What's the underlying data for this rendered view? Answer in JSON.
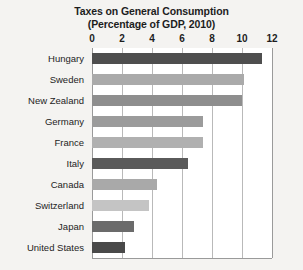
{
  "chart_data": {
    "type": "bar",
    "orientation": "horizontal",
    "title": "Taxes on General Consumption",
    "subtitle": "(Percentage of GDP, 2010)",
    "xlabel": "",
    "ylabel": "",
    "xlim": [
      0,
      12
    ],
    "xticks": [
      0,
      2,
      4,
      6,
      8,
      10,
      12
    ],
    "xtick_labels": [
      "0",
      "2",
      "4",
      "6",
      "8",
      "10",
      "12"
    ],
    "grid": "vertical",
    "legend": "none",
    "categories": [
      "Hungary",
      "Sweden",
      "New Zealand",
      "Germany",
      "France",
      "Italy",
      "Canada",
      "Switzerland",
      "Japan",
      "United States"
    ],
    "values": [
      11.3,
      10.1,
      10.0,
      7.4,
      7.4,
      6.4,
      4.3,
      3.8,
      2.8,
      2.2
    ],
    "bar_colors": [
      "#4e4e4e",
      "#aaaaaa",
      "#8e8e8e",
      "#9b9b9b",
      "#b0b0b0",
      "#5a5a5a",
      "#a9a9a9",
      "#c4c4c4",
      "#6b6b6b",
      "#494949"
    ]
  },
  "style": {
    "page_background": "#f4f3f1",
    "plot_background": "#ffffff",
    "gridline_color": "#b9b9b9",
    "axis_color": "#9a9a9a",
    "text_color": "#1d1d1d"
  }
}
